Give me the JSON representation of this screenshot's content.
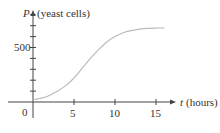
{
  "chart_data": {
    "type": "line",
    "title": "",
    "xlabel_var": "t",
    "xlabel_unit": "(hours)",
    "ylabel_var": "P",
    "ylabel_unit": "(yeast cells)",
    "x_ticks": [
      0,
      5,
      10,
      15
    ],
    "x_tick_labels": [
      "0",
      "5",
      "10",
      "15"
    ],
    "y_ticks_minor_step": 100,
    "y_tick_labels": [
      "500"
    ],
    "xlim": [
      0,
      17
    ],
    "ylim": [
      0,
      850
    ],
    "grid": false,
    "series": [
      {
        "name": "P(t) logistic growth",
        "x": [
          0,
          1,
          2,
          3,
          4,
          5,
          6,
          7,
          8,
          9,
          10,
          11,
          12,
          13,
          14,
          15,
          16
        ],
        "values": [
          20,
          35,
          60,
          100,
          150,
          220,
          310,
          400,
          480,
          550,
          600,
          635,
          655,
          668,
          675,
          678,
          680
        ],
        "color": "#bbbbbb"
      }
    ]
  },
  "labels": {
    "origin": "0",
    "y_500": "500",
    "x_5": "5",
    "x_10": "10",
    "x_15": "15",
    "y_var": "P",
    "y_unit": "(yeast cells)",
    "x_var": "t",
    "x_unit": "(hours)"
  },
  "colors": {
    "axis": "#444444",
    "curve": "#bbbbbb"
  }
}
